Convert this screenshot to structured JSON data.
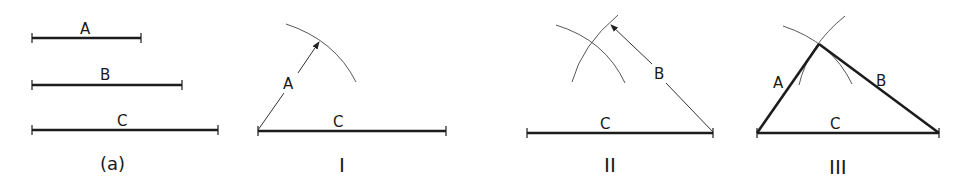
{
  "figure": {
    "panels": [
      {
        "id": "a",
        "caption": "(a)",
        "segments": [
          {
            "label": "A"
          },
          {
            "label": "B"
          },
          {
            "label": "C"
          }
        ]
      },
      {
        "id": "I",
        "caption": "I",
        "base_label": "C",
        "radius_label": "A"
      },
      {
        "id": "II",
        "caption": "II",
        "base_label": "C",
        "radius_label": "B"
      },
      {
        "id": "III",
        "caption": "III",
        "base_label": "C",
        "left_side_label": "A",
        "right_side_label": "B"
      }
    ]
  }
}
